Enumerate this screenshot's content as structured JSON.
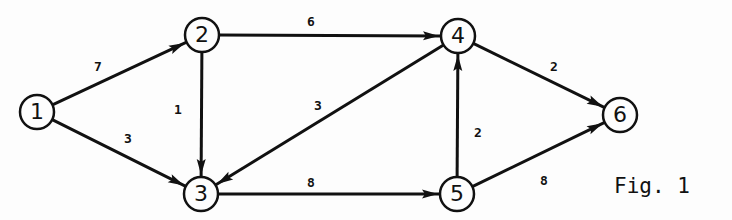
{
  "diagram": {
    "type": "directed-weighted-graph",
    "caption": "Fig. 1",
    "nodes": [
      {
        "id": "1",
        "label": "1",
        "x": 37,
        "y": 112
      },
      {
        "id": "2",
        "label": "2",
        "x": 202,
        "y": 35
      },
      {
        "id": "3",
        "label": "3",
        "x": 201,
        "y": 194
      },
      {
        "id": "4",
        "label": "4",
        "x": 458,
        "y": 36
      },
      {
        "id": "5",
        "label": "5",
        "x": 457,
        "y": 194
      },
      {
        "id": "6",
        "label": "6",
        "x": 620,
        "y": 115
      }
    ],
    "edges": [
      {
        "from": "1",
        "to": "2",
        "weight": "7",
        "lx": 98,
        "ly": 67
      },
      {
        "from": "1",
        "to": "3",
        "weight": "3",
        "lx": 128,
        "ly": 139
      },
      {
        "from": "2",
        "to": "3",
        "weight": "1",
        "lx": 178,
        "ly": 110
      },
      {
        "from": "2",
        "to": "4",
        "weight": "6",
        "lx": 311,
        "ly": 22
      },
      {
        "from": "4",
        "to": "3",
        "weight": "3",
        "lx": 318,
        "ly": 106
      },
      {
        "from": "3",
        "to": "5",
        "weight": "8",
        "lx": 311,
        "ly": 183
      },
      {
        "from": "5",
        "to": "4",
        "weight": "2",
        "lx": 478,
        "ly": 133
      },
      {
        "from": "4",
        "to": "6",
        "weight": "2",
        "lx": 554,
        "ly": 67
      },
      {
        "from": "5",
        "to": "6",
        "weight": "8",
        "lx": 544,
        "ly": 181
      }
    ],
    "colors": {
      "stroke": "#111111",
      "background": "#fdfdfd"
    }
  }
}
